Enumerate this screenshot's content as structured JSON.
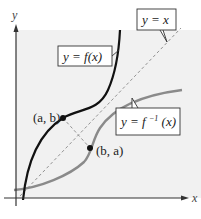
{
  "figure": {
    "axes": {
      "x_label": "x",
      "y_label": "y"
    },
    "labels": {
      "f": "y = f(x)",
      "identity": "y = x",
      "finv_prefix": "y = f",
      "finv_sup": "−1",
      "finv_suffix": "(x)"
    },
    "points": {
      "ab": "(a, b)",
      "ba": "(b, a)"
    },
    "colors": {
      "plot_bg": "#f1f1f1",
      "f_curve": "#111111",
      "finv_curve": "#8a8a8a",
      "identity_line": "#888888",
      "axis": "#333333"
    }
  }
}
